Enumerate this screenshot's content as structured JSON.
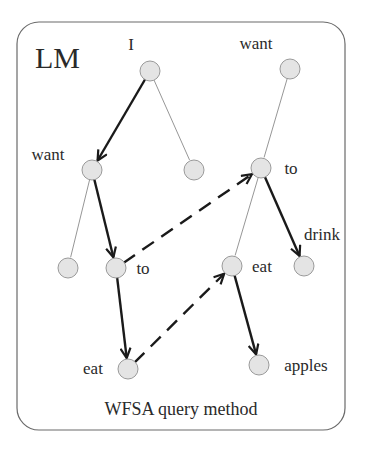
{
  "title": "LM",
  "caption": "WFSA query method",
  "colors": {
    "frame": "#6a6a6a",
    "node_fill": "#e4e4e4",
    "node_stroke": "#9a9a9a",
    "thin_edge": "#8a8a8a",
    "bold_edge": "#1a1a1a",
    "text": "#2a2a2a"
  },
  "nodes": [
    {
      "id": "n_I",
      "label": "I",
      "cx": 150,
      "cy": 71,
      "lx": 131,
      "ly": 50
    },
    {
      "id": "n_want_right",
      "label": "want",
      "cx": 290,
      "cy": 69,
      "lx": 256,
      "ly": 49
    },
    {
      "id": "n_want_left",
      "label": "want",
      "cx": 92,
      "cy": 170,
      "lx": 48,
      "ly": 160
    },
    {
      "id": "n_mid",
      "label": "",
      "cx": 194,
      "cy": 170,
      "lx": 0,
      "ly": 0
    },
    {
      "id": "n_to_right",
      "label": "to",
      "cx": 261,
      "cy": 168,
      "lx": 291,
      "ly": 174
    },
    {
      "id": "n_leaf_left",
      "label": "",
      "cx": 68,
      "cy": 268,
      "lx": 0,
      "ly": 0
    },
    {
      "id": "n_to_left",
      "label": "to",
      "cx": 116,
      "cy": 268,
      "lx": 143,
      "ly": 274
    },
    {
      "id": "n_eat_right",
      "label": "eat",
      "cx": 232,
      "cy": 266,
      "lx": 262,
      "ly": 272
    },
    {
      "id": "n_drink",
      "label": "drink",
      "cx": 304,
      "cy": 266,
      "lx": 322,
      "ly": 240
    },
    {
      "id": "n_eat_left",
      "label": "eat",
      "cx": 128,
      "cy": 369,
      "lx": 93,
      "ly": 374
    },
    {
      "id": "n_apples",
      "label": "apples",
      "cx": 259,
      "cy": 365,
      "lx": 306,
      "ly": 371
    }
  ],
  "edges": [
    {
      "from": "n_I",
      "to": "n_want_left",
      "style": "bold"
    },
    {
      "from": "n_I",
      "to": "n_mid",
      "style": "thin"
    },
    {
      "from": "n_want_left",
      "to": "n_leaf_left",
      "style": "thin"
    },
    {
      "from": "n_want_left",
      "to": "n_to_left",
      "style": "bold"
    },
    {
      "from": "n_to_left",
      "to": "n_eat_left",
      "style": "bold"
    },
    {
      "from": "n_want_right",
      "to": "n_to_right",
      "style": "thin"
    },
    {
      "from": "n_to_right",
      "to": "n_eat_right",
      "style": "thin"
    },
    {
      "from": "n_to_right",
      "to": "n_drink",
      "style": "bold"
    },
    {
      "from": "n_eat_right",
      "to": "n_apples",
      "style": "bold"
    },
    {
      "from": "n_to_left",
      "to": "n_to_right",
      "style": "dashed"
    },
    {
      "from": "n_eat_left",
      "to": "n_eat_right",
      "style": "dashed"
    }
  ]
}
